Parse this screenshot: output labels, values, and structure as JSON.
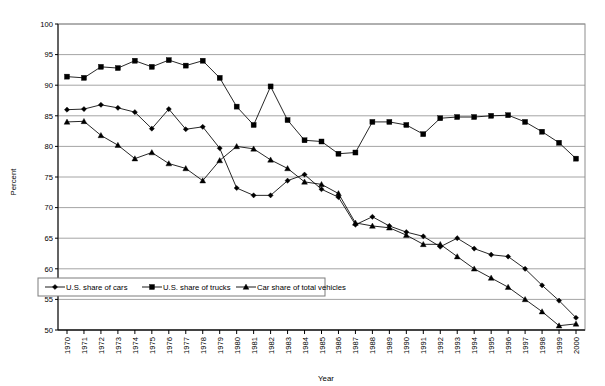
{
  "chart_data": {
    "type": "line",
    "title": "",
    "xlabel": "Year",
    "ylabel": "Percent",
    "ylim": [
      50,
      100
    ],
    "ytick_step": 5,
    "grid": true,
    "legend_position": "inside-bottom-left",
    "categories": [
      "1970",
      "1971",
      "1972",
      "1973",
      "1974",
      "1975",
      "1976",
      "1977",
      "1978",
      "1979",
      "1980",
      "1981",
      "1982",
      "1983",
      "1984",
      "1985",
      "1986",
      "1987",
      "1988",
      "1989",
      "1990",
      "1991",
      "1992",
      "1993",
      "1994",
      "1995",
      "1996",
      "1997",
      "1998",
      "1999",
      "2000"
    ],
    "yticks": [
      50,
      55,
      60,
      65,
      70,
      75,
      80,
      85,
      90,
      95,
      100
    ],
    "series": [
      {
        "name": "U.S. share of cars",
        "marker": "diamond",
        "values": [
          86.0,
          86.1,
          86.8,
          86.3,
          85.6,
          82.9,
          86.1,
          82.8,
          83.2,
          79.7,
          73.2,
          72.0,
          72.0,
          74.4,
          75.4,
          73.0,
          71.7,
          67.2,
          68.5,
          67.0,
          66.0,
          65.3,
          63.6,
          65.0,
          63.3,
          62.3,
          62.0,
          60.0,
          57.3,
          54.8,
          52.0
        ]
      },
      {
        "name": "U.S. share of trucks",
        "marker": "square",
        "values": [
          91.4,
          91.2,
          93.0,
          92.8,
          94.0,
          93.0,
          94.1,
          93.2,
          94.0,
          91.2,
          86.5,
          83.5,
          89.8,
          84.3,
          81.0,
          80.8,
          78.8,
          79.0,
          84.0,
          84.0,
          83.5,
          82.0,
          84.6,
          84.8,
          84.8,
          85.0,
          85.1,
          84.0,
          82.4,
          80.6,
          78.0
        ]
      },
      {
        "name": "Car share of total vehicles",
        "marker": "triangle",
        "values": [
          84.0,
          84.1,
          81.8,
          80.2,
          78.0,
          79.0,
          77.2,
          76.4,
          74.4,
          77.7,
          80.0,
          79.6,
          77.8,
          76.4,
          74.2,
          73.8,
          72.3,
          67.5,
          67.0,
          66.7,
          65.5,
          64.0,
          64.0,
          62.0,
          60.0,
          58.5,
          57.0,
          55.0,
          53.0,
          50.7,
          51.0
        ]
      }
    ]
  },
  "legend": {
    "items": [
      {
        "label": "U.S. share of cars",
        "marker": "diamond"
      },
      {
        "label": "U.S. share of trucks",
        "marker": "square"
      },
      {
        "label": "Car share of total vehicles",
        "marker": "triangle"
      }
    ]
  },
  "axes": {
    "y_title": "Percent",
    "x_title": "Year"
  }
}
